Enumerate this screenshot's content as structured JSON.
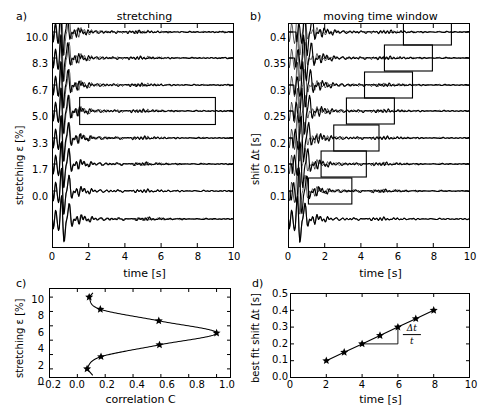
{
  "figure": {
    "panels": [
      "a)",
      "b)",
      "c)",
      "d)"
    ]
  },
  "panel_a": {
    "label": "a)",
    "title": "stretching",
    "xlabel": "time [s]",
    "ylabel": "stretching ε [%]",
    "xticks": [
      "0",
      "2",
      "4",
      "6",
      "8",
      "10"
    ],
    "yticks": [
      "10.0",
      "8.3",
      "6.7",
      "5.0",
      "3.3",
      "1.7",
      "0.0"
    ]
  },
  "panel_b": {
    "label": "b)",
    "title": "moving time window",
    "xlabel": "time [s]",
    "ylabel": "shift Δt [s]",
    "xticks": [
      "0",
      "2",
      "4",
      "6",
      "8",
      "10"
    ],
    "yticks": [
      "0.4",
      "0.35",
      "0.3",
      "0.25",
      "0.2",
      "0.15",
      "0.1"
    ]
  },
  "panel_c": {
    "label": "c)",
    "xlabel": "correlation C",
    "ylabel": "stretching ε [%]",
    "xticks": [
      "−0.2",
      "0.0",
      "0.2",
      "0.4",
      "0.6",
      "0.8",
      "1.0"
    ],
    "yticks": [
      "0",
      "2",
      "4",
      "6",
      "8",
      "10"
    ]
  },
  "panel_d": {
    "label": "d)",
    "xlabel": "time [s]",
    "ylabel": "best fit shift Δt [s]",
    "xticks": [
      "0",
      "2",
      "4",
      "6",
      "8",
      "10"
    ],
    "yticks": [
      "0.0",
      "0.1",
      "0.2",
      "0.3",
      "0.4",
      "0.5"
    ],
    "annotation_numerator": "Δt",
    "annotation_denominator": "t"
  },
  "chart_data": [
    {
      "type": "line",
      "panel": "a",
      "title": "stretching",
      "xlabel": "time [s]",
      "ylabel": "stretching ε [%]",
      "xlim": [
        0,
        10
      ],
      "grid": false,
      "legend": null,
      "description": "Eight seismic waveform traces offset vertically, each a reference trace overlaid with a stretched version; stretching factor labels on y-axis. A highlight window box is drawn on the trace at 5.0 %.",
      "trace_offsets": [
        10.0,
        8.3,
        6.7,
        5.0,
        3.3,
        1.7,
        0.0,
        -1.7
      ],
      "ytick_values": [
        10.0,
        8.3,
        6.7,
        5.0,
        3.3,
        1.7,
        0.0
      ],
      "stretch_factors": [
        1.1,
        1.083,
        1.067,
        1.05,
        1.033,
        1.017,
        1.0,
        0.983
      ],
      "highlight_window": {
        "trace_index": 3,
        "t_start": 1.5,
        "t_end": 9.0
      }
    },
    {
      "type": "line",
      "panel": "b",
      "title": "moving time window",
      "xlabel": "time [s]",
      "ylabel": "shift Δt [s]",
      "xlim": [
        0,
        10
      ],
      "grid": false,
      "legend": null,
      "description": "Eight seismic waveform traces offset vertically; a time window box slides progressively later with increasing shift Δt.",
      "ytick_values": [
        0.4,
        0.35,
        0.3,
        0.25,
        0.2,
        0.15,
        0.1
      ],
      "windows": [
        {
          "shift": 0.4,
          "t_start": 6.35,
          "t_end": 9.0
        },
        {
          "shift": 0.35,
          "t_start": 5.3,
          "t_end": 7.95
        },
        {
          "shift": 0.3,
          "t_start": 4.2,
          "t_end": 6.85
        },
        {
          "shift": 0.25,
          "t_start": 3.2,
          "t_end": 5.85
        },
        {
          "shift": 0.2,
          "t_start": 2.5,
          "t_end": 5.0
        },
        {
          "shift": 0.15,
          "t_start": 1.8,
          "t_end": 4.3
        },
        {
          "shift": 0.1,
          "t_start": 1.1,
          "t_end": 3.5
        }
      ]
    },
    {
      "type": "scatter",
      "panel": "c",
      "title": "",
      "xlabel": "correlation C",
      "ylabel": "stretching ε [%]",
      "xlim": [
        -0.2,
        1.1
      ],
      "ylim": [
        -1.2,
        11.2
      ],
      "grid": false,
      "marker": "star",
      "x": [
        0.07,
        0.17,
        0.59,
        1.0,
        0.585,
        0.165,
        0.085
      ],
      "y": [
        0.0,
        1.7,
        3.35,
        5.0,
        6.7,
        8.3,
        10.0
      ],
      "xticks": [
        -0.2,
        0.0,
        0.2,
        0.4,
        0.6,
        0.8,
        1.0
      ],
      "yticks": [
        0,
        2,
        4,
        6,
        8,
        10
      ],
      "description": "Correlation coefficient versus stretching factor, forming a peaked C-shaped curve with maximum correlation 1.0 at 5 % stretching."
    },
    {
      "type": "scatter",
      "panel": "d",
      "title": "",
      "xlabel": "time [s]",
      "ylabel": "best fit shift Δt [s]",
      "xlim": [
        0,
        10
      ],
      "ylim": [
        0.0,
        0.5
      ],
      "grid": false,
      "marker": "star",
      "x": [
        2,
        3,
        4,
        5,
        6,
        7,
        8
      ],
      "y": [
        0.1,
        0.15,
        0.2,
        0.25,
        0.3,
        0.35,
        0.4
      ],
      "xticks": [
        0,
        2,
        4,
        6,
        8,
        10
      ],
      "yticks": [
        0.0,
        0.1,
        0.2,
        0.3,
        0.4,
        0.5
      ],
      "annotation": {
        "numerator": "Δt",
        "denominator": "t",
        "slope": 0.05
      },
      "description": "Best fit time shift increases linearly with lapse time; slope equals the relative velocity change Δt/t."
    }
  ]
}
